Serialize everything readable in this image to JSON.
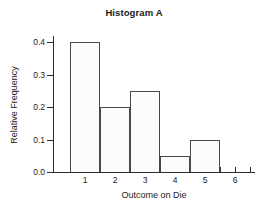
{
  "chart_data": {
    "type": "bar",
    "title": "Histogram A",
    "xlabel": "Outcome on Die",
    "ylabel": "Relative Frequency",
    "categories": [
      "1",
      "2",
      "3",
      "4",
      "5",
      "6"
    ],
    "values": [
      0.4,
      0.2,
      0.25,
      0.05,
      0.1,
      0.0
    ],
    "xlim": [
      0.5,
      6.5
    ],
    "ylim": [
      0.0,
      0.4
    ],
    "ytick_labels": [
      "0.0",
      "0.1",
      "0.2",
      "0.3",
      "0.4"
    ],
    "ytick_values": [
      0.0,
      0.1,
      0.2,
      0.3,
      0.4
    ],
    "xtick_labels": [
      "1",
      "2",
      "3",
      "4",
      "5",
      "6"
    ],
    "grid": false,
    "legend": false,
    "bar_fill_color": "#fcfcfc",
    "bar_edge_color": "#4a4a4a",
    "axis_color": "#2b2b2b",
    "text_color": "#1a1a1a",
    "background_color": "#ffffff"
  }
}
